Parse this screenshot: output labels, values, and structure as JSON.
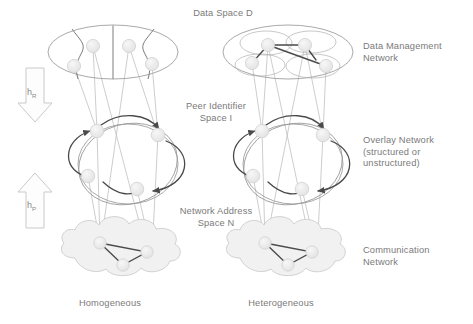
{
  "figure": {
    "title_top": "Data Space D",
    "mid_label": "Peer Identifier\nSpace I",
    "low_label": "Network Address\nSpace N",
    "right_labels": {
      "data_management": "Data Management\nNetwork",
      "overlay": "Overlay Network\n(structured or\nunstructured)",
      "communication": "Communication\nNetwork"
    },
    "columns": [
      {
        "name": "left-column",
        "caption": "Homogeneous"
      },
      {
        "name": "right-column",
        "caption": "Heterogeneous"
      }
    ],
    "mapping_arrows": [
      {
        "name": "down-arrow",
        "direction": "down",
        "symbol": "h",
        "subscript": "R"
      },
      {
        "name": "up-arrow",
        "direction": "up",
        "symbol": "h",
        "subscript": "P"
      }
    ],
    "layers": [
      {
        "name": "data-space-layer",
        "shape": "ellipse",
        "label": "Data Space D"
      },
      {
        "name": "peer-identifier-layer",
        "shape": "ring",
        "label": "Peer Identifier Space I"
      },
      {
        "name": "network-address-layer",
        "shape": "cloud",
        "label": "Network Address Space N"
      }
    ],
    "colors": {
      "text": "#7a7a7a",
      "outline": "#8c8c8c",
      "node_fill": "#ededed",
      "node_stroke": "#cfcfcf",
      "edge_dark": "#4a4a4a",
      "edge_light": "#b8b8b8",
      "cloud_fill": "#f0f0f0",
      "background": "#ffffff"
    },
    "node_counts": {
      "data_space_left": 4,
      "data_space_right": 4,
      "overlay": 4,
      "communication": 3,
      "right_subregions": 4
    }
  }
}
